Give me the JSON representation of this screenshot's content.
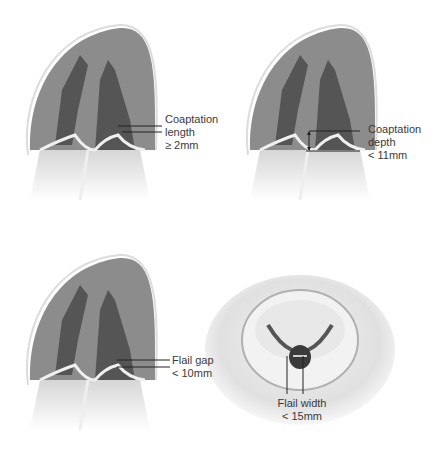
{
  "figure": {
    "colors": {
      "background": "#ffffff",
      "ventricle_outer": "#8c8c8c",
      "myocardium_dark": "#555555",
      "chamber_light": "#c8c8c8",
      "leaflet": "#eeeeee",
      "line": "#222222",
      "label": "#3a3a3a"
    },
    "panels": [
      {
        "id": "coaptation-length",
        "view": "long-axis ventricle",
        "label_lines": [
          "Coaptation",
          "length",
          "≥ 2mm"
        ]
      },
      {
        "id": "coaptation-depth",
        "view": "long-axis ventricle",
        "label_lines": [
          "Coaptation",
          "depth",
          "< 11mm"
        ]
      },
      {
        "id": "flail-gap",
        "view": "long-axis ventricle",
        "label_lines": [
          "Flail gap",
          "< 10mm"
        ]
      },
      {
        "id": "flail-width",
        "view": "short-axis valve",
        "label_lines": [
          "Flail width",
          "< 15mm"
        ]
      }
    ]
  }
}
